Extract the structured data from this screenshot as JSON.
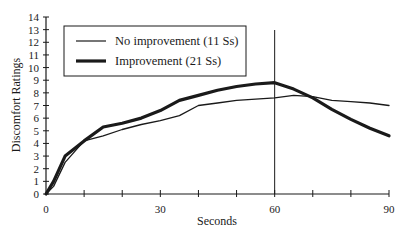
{
  "chart_data": {
    "type": "line",
    "title": "",
    "xlabel": "Seconds",
    "ylabel": "Discomfort Ratings",
    "xlim": [
      0,
      90
    ],
    "ylim": [
      0,
      14
    ],
    "x_ticks": [
      0,
      10,
      20,
      30,
      40,
      50,
      60,
      70,
      80,
      90
    ],
    "x_tick_labels": [
      "0",
      "",
      "",
      "30",
      "",
      "",
      "60",
      "",
      "",
      "90"
    ],
    "y_ticks": [
      0,
      1,
      2,
      3,
      4,
      5,
      6,
      7,
      8,
      9,
      10,
      11,
      12,
      13,
      14
    ],
    "y_tick_labels": [
      "0",
      "1",
      "2",
      "3",
      "4",
      "5",
      "6",
      "7",
      "8",
      "9",
      "10",
      "11",
      "12",
      "13",
      "14"
    ],
    "grid": false,
    "legend_position": "top-left",
    "reference_line": {
      "orientation": "vertical",
      "x": 60
    },
    "x": [
      0,
      2,
      5,
      10,
      15,
      20,
      25,
      30,
      35,
      40,
      45,
      50,
      55,
      60,
      65,
      70,
      75,
      80,
      85,
      90
    ],
    "series": [
      {
        "name": "No improvement (11 Ss)",
        "style": "thin",
        "values": [
          0,
          0.6,
          2.5,
          4.2,
          4.6,
          5.1,
          5.5,
          5.8,
          6.2,
          7.0,
          7.2,
          7.4,
          7.5,
          7.6,
          7.8,
          7.7,
          7.4,
          7.3,
          7.2,
          7.0
        ]
      },
      {
        "name": "Improvement (21 Ss)",
        "style": "thick",
        "values": [
          0,
          1.0,
          3.0,
          4.2,
          5.3,
          5.6,
          6.0,
          6.6,
          7.4,
          7.8,
          8.2,
          8.5,
          8.7,
          8.8,
          8.3,
          7.6,
          6.7,
          5.9,
          5.2,
          4.6
        ]
      }
    ]
  },
  "colors": {
    "ink": "#1a1a1a",
    "background": "#ffffff"
  }
}
